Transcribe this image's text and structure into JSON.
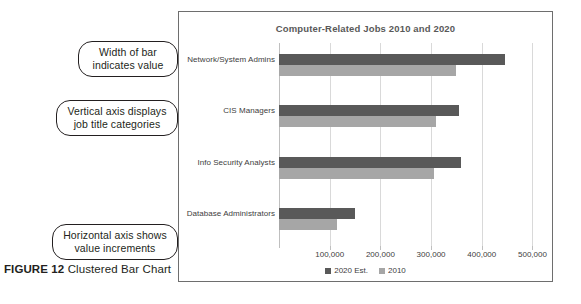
{
  "figure": {
    "label": "FIGURE 12",
    "caption": " Clustered Bar Chart"
  },
  "callouts": [
    {
      "id": "width-of-bar",
      "text": "Width of bar indicates value"
    },
    {
      "id": "vertical-axis",
      "text": "Vertical axis displays job title categories"
    },
    {
      "id": "horizontal-axis",
      "text": "Horizontal axis shows value increments"
    }
  ],
  "chart_data": {
    "type": "bar",
    "orientation": "horizontal",
    "title": "Computer-Related Jobs 2010 and 2020",
    "xlabel": "",
    "ylabel": "",
    "categories": [
      "Network/System Admins",
      "CIS Managers",
      "Info Security Analysts",
      "Database Administrators"
    ],
    "series": [
      {
        "name": "2020 Est.",
        "color": "#595959",
        "values": [
          445000,
          355000,
          360000,
          150000
        ]
      },
      {
        "name": "2010",
        "color": "#a6a6a6",
        "values": [
          350000,
          310000,
          305000,
          115000
        ]
      }
    ],
    "xlim": [
      0,
      505000
    ],
    "xticks": [
      100000,
      200000,
      300000,
      400000,
      500000
    ],
    "xtick_labels": [
      "100,000",
      "200,000",
      "300,000",
      "400,000",
      "500,000"
    ],
    "grid": true,
    "legend_position": "bottom"
  }
}
